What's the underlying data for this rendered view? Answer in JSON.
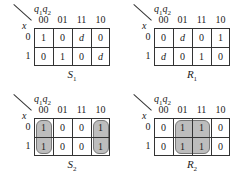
{
  "figure": {
    "col_var_label": "q1q2",
    "row_var_label": "x",
    "col_headers": [
      "00",
      "01",
      "11",
      "10"
    ],
    "row_headers": [
      "0",
      "1"
    ],
    "maps": [
      {
        "name": "S1",
        "letter": "S",
        "sub": "1",
        "cells": [
          [
            "1",
            "0",
            "d",
            "0"
          ],
          [
            "0",
            "1",
            "0",
            "d"
          ]
        ],
        "groups": []
      },
      {
        "name": "R1",
        "letter": "R",
        "sub": "1",
        "cells": [
          [
            "0",
            "d",
            "0",
            "1"
          ],
          [
            "d",
            "0",
            "1",
            "0"
          ]
        ],
        "groups": []
      },
      {
        "name": "S2",
        "letter": "S",
        "sub": "2",
        "cells": [
          [
            "1",
            "0",
            "0",
            "1"
          ],
          [
            "1",
            "0",
            "0",
            "1"
          ]
        ],
        "groups": [
          {
            "cols": [
              0
            ],
            "rows": [
              0,
              1
            ]
          },
          {
            "cols": [
              3
            ],
            "rows": [
              0,
              1
            ]
          }
        ]
      },
      {
        "name": "R2",
        "letter": "R",
        "sub": "2",
        "cells": [
          [
            "0",
            "1",
            "1",
            "0"
          ],
          [
            "0",
            "1",
            "1",
            "0"
          ]
        ],
        "groups": [
          {
            "cols": [
              1,
              2
            ],
            "rows": [
              0,
              1
            ]
          }
        ]
      }
    ]
  }
}
